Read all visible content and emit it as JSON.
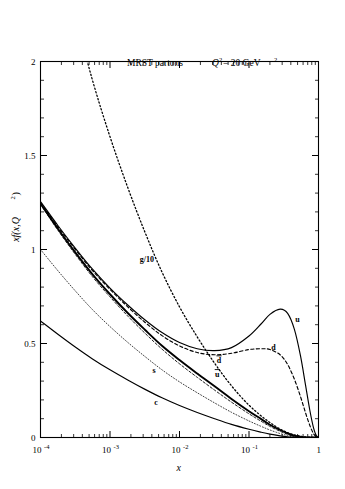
{
  "figure": {
    "annotations": {
      "model": "MRST partons",
      "scale_q": "Q",
      "scale_exp": "2",
      "scale_eq": " = 20 GeV",
      "scale_unit_exp": "2"
    },
    "yaxis": {
      "label_main": "xf(x,Q",
      "label_sup": "2",
      "label_tail": ")",
      "ticks": [
        "0",
        "0.5",
        "1",
        "1.5",
        "2"
      ]
    },
    "xaxis": {
      "label": "x",
      "ticks": [
        {
          "mant": "10",
          "exp": "-4"
        },
        {
          "mant": "10",
          "exp": "-3"
        },
        {
          "mant": "10",
          "exp": "-2"
        },
        {
          "mant": "10",
          "exp": "-1"
        },
        {
          "mant": "1",
          "exp": ""
        }
      ]
    },
    "curve_labels": {
      "gluon": "g/10",
      "up": "u",
      "down": "d",
      "dbar": "d",
      "ubar": "u",
      "strange": "s",
      "charm": "c",
      "bar_mark": "̅"
    }
  },
  "chart_data": {
    "type": "line",
    "xlabel": "x",
    "ylabel": "xf(x,Q^2)",
    "xscale": "log",
    "yscale": "linear",
    "xlim": [
      0.0001,
      1
    ],
    "ylim": [
      0,
      2
    ],
    "xticks": [
      0.0001,
      0.001,
      0.01,
      0.1,
      1
    ],
    "xticklabels": [
      "10^-4",
      "10^-3",
      "10^-2",
      "10^-1",
      "1"
    ],
    "yticks": [
      0,
      0.5,
      1,
      1.5,
      2
    ],
    "yticklabels": [
      "0",
      "0.5",
      "1",
      "1.5",
      "2"
    ],
    "grid": false,
    "legend": "inline-curve-labels",
    "series": [
      {
        "name": "g/10",
        "label": "g/10",
        "style": "dotted",
        "x": [
          0.0001,
          0.00018,
          0.00032,
          0.00056,
          0.001,
          0.0018,
          0.0032,
          0.0056,
          0.01,
          0.018,
          0.032,
          0.056,
          0.1,
          0.18,
          0.32,
          0.56,
          1.0
        ],
        "y": [
          3.05,
          2.62,
          2.24,
          1.9,
          1.6,
          1.33,
          1.09,
          0.88,
          0.695,
          0.535,
          0.395,
          0.275,
          0.172,
          0.092,
          0.034,
          0.006,
          0.0
        ]
      },
      {
        "name": "u",
        "label": "u",
        "style": "solid",
        "x": [
          0.0001,
          0.00018,
          0.00032,
          0.00056,
          0.001,
          0.0018,
          0.0032,
          0.0056,
          0.01,
          0.018,
          0.032,
          0.056,
          0.1,
          0.15,
          0.2,
          0.28,
          0.36,
          0.45,
          0.55,
          0.65,
          0.75,
          0.85,
          0.93,
          1.0
        ],
        "y": [
          1.255,
          1.125,
          1.005,
          0.895,
          0.795,
          0.705,
          0.625,
          0.558,
          0.505,
          0.472,
          0.462,
          0.478,
          0.54,
          0.605,
          0.655,
          0.683,
          0.66,
          0.575,
          0.435,
          0.28,
          0.145,
          0.05,
          0.01,
          0.0
        ]
      },
      {
        "name": "d",
        "label": "d",
        "style": "dashed",
        "x": [
          0.0001,
          0.00018,
          0.00032,
          0.00056,
          0.001,
          0.0018,
          0.0032,
          0.0056,
          0.01,
          0.018,
          0.032,
          0.056,
          0.1,
          0.15,
          0.2,
          0.28,
          0.36,
          0.45,
          0.55,
          0.65,
          0.75,
          0.85,
          0.93,
          1.0
        ],
        "y": [
          1.25,
          1.118,
          0.998,
          0.888,
          0.788,
          0.695,
          0.612,
          0.542,
          0.487,
          0.452,
          0.44,
          0.448,
          0.468,
          0.472,
          0.468,
          0.44,
          0.388,
          0.31,
          0.218,
          0.132,
          0.064,
          0.02,
          0.004,
          0.0
        ]
      },
      {
        "name": "dbar",
        "label": "d-bar",
        "style": "solid-thick",
        "x": [
          0.0001,
          0.00018,
          0.00032,
          0.00056,
          0.001,
          0.0018,
          0.0032,
          0.0056,
          0.01,
          0.018,
          0.032,
          0.056,
          0.1,
          0.15,
          0.2,
          0.28,
          0.36,
          0.45,
          0.6,
          0.8,
          1.0
        ],
        "y": [
          1.245,
          1.108,
          0.982,
          0.868,
          0.762,
          0.662,
          0.572,
          0.488,
          0.412,
          0.34,
          0.272,
          0.205,
          0.14,
          0.098,
          0.068,
          0.04,
          0.022,
          0.01,
          0.002,
          0.0,
          0.0
        ]
      },
      {
        "name": "ubar",
        "label": "u-bar",
        "style": "dashed-fine",
        "x": [
          0.0001,
          0.00018,
          0.00032,
          0.00056,
          0.001,
          0.0018,
          0.0032,
          0.0056,
          0.01,
          0.018,
          0.032,
          0.056,
          0.1,
          0.15,
          0.2,
          0.28,
          0.36,
          0.45,
          0.6,
          0.8,
          1.0
        ],
        "y": [
          1.24,
          1.1,
          0.972,
          0.855,
          0.748,
          0.646,
          0.554,
          0.47,
          0.392,
          0.32,
          0.252,
          0.188,
          0.126,
          0.086,
          0.059,
          0.033,
          0.017,
          0.008,
          0.001,
          0.0,
          0.0
        ]
      },
      {
        "name": "s",
        "label": "s",
        "style": "dotted-fine",
        "x": [
          0.0001,
          0.00018,
          0.00032,
          0.00056,
          0.001,
          0.0018,
          0.0032,
          0.0056,
          0.01,
          0.018,
          0.032,
          0.056,
          0.1,
          0.15,
          0.2,
          0.28,
          0.36,
          0.45,
          0.6,
          0.8,
          1.0
        ],
        "y": [
          1.0,
          0.885,
          0.778,
          0.68,
          0.59,
          0.506,
          0.43,
          0.36,
          0.296,
          0.238,
          0.184,
          0.134,
          0.088,
          0.059,
          0.04,
          0.021,
          0.011,
          0.005,
          0.001,
          0.0,
          0.0
        ]
      },
      {
        "name": "c",
        "label": "c",
        "style": "solid",
        "x": [
          0.0001,
          0.00018,
          0.00032,
          0.00056,
          0.001,
          0.0018,
          0.0032,
          0.0056,
          0.01,
          0.018,
          0.032,
          0.056,
          0.1,
          0.15,
          0.2,
          0.28,
          0.36,
          0.45,
          0.6,
          0.8,
          1.0
        ],
        "y": [
          0.62,
          0.548,
          0.48,
          0.418,
          0.36,
          0.306,
          0.256,
          0.211,
          0.17,
          0.133,
          0.1,
          0.07,
          0.044,
          0.028,
          0.018,
          0.009,
          0.004,
          0.002,
          0.0,
          0.0,
          0.0
        ]
      }
    ],
    "annotations": [
      {
        "text": "MRST partons",
        "x": 0.012,
        "y": 1.82
      },
      {
        "text": "Q^2 = 20 GeV^2",
        "x": 0.12,
        "y": 1.82
      },
      {
        "text": "g/10",
        "x": 0.0032,
        "y": 0.95
      },
      {
        "text": "u",
        "x": 0.48,
        "y": 0.62
      },
      {
        "text": "d",
        "x": 0.22,
        "y": 0.47
      },
      {
        "text": "d-bar",
        "x": 0.036,
        "y": 0.4
      },
      {
        "text": "u-bar",
        "x": 0.034,
        "y": 0.33
      },
      {
        "text": "s",
        "x": 0.0042,
        "y": 0.345
      },
      {
        "text": "c",
        "x": 0.0045,
        "y": 0.175
      }
    ]
  }
}
